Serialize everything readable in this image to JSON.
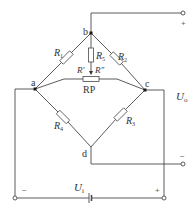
{
  "diagram": {
    "type": "wheatstone-bridge-circuit",
    "nodes": {
      "a": "a",
      "b": "b",
      "c": "c",
      "d": "d"
    },
    "resistors": {
      "r1": {
        "main": "R",
        "sub": "1"
      },
      "r2": {
        "main": "R",
        "sub": "2"
      },
      "r3": {
        "main": "R",
        "sub": "3"
      },
      "r4": {
        "main": "R",
        "sub": "4"
      },
      "r5": {
        "main": "R",
        "sub": "5"
      }
    },
    "potentiometer": {
      "label": "RP",
      "left_part": "R′",
      "right_part": "R″"
    },
    "output": {
      "main": "U",
      "sub": "o",
      "plus": "+",
      "minus": "−"
    },
    "input": {
      "main": "U",
      "sub": "i",
      "plus": "+",
      "minus": "−"
    },
    "colors": {
      "wire": "#4a4a4a",
      "background": "#ffffff"
    }
  }
}
